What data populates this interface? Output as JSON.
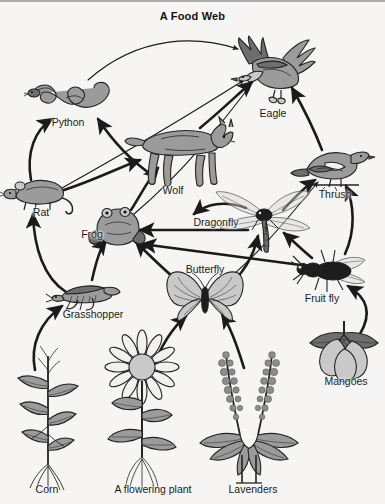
{
  "title": "A Food Web",
  "background_color": "#f6f5f3",
  "ink_color": "#232323",
  "organisms": [
    {
      "id": "python",
      "label": "Python",
      "label_x": 68,
      "label_y": 122,
      "x": 72,
      "y": 94,
      "group": "predator"
    },
    {
      "id": "eagle",
      "label": "Eagle",
      "label_x": 273,
      "label_y": 113,
      "x": 277,
      "y": 73,
      "group": "predator"
    },
    {
      "id": "wolf",
      "label": "Wolf",
      "label_x": 173,
      "label_y": 190,
      "x": 180,
      "y": 153,
      "group": "predator"
    },
    {
      "id": "thrush",
      "label": "Thrush",
      "label_x": 335,
      "label_y": 194,
      "x": 333,
      "y": 167,
      "group": "predator"
    },
    {
      "id": "rat",
      "label": "Rat",
      "label_x": 41,
      "label_y": 212,
      "x": 40,
      "y": 194,
      "group": "consumer"
    },
    {
      "id": "frog",
      "label": "Frog",
      "label_x": 92,
      "label_y": 234,
      "x": 118,
      "y": 226,
      "group": "consumer"
    },
    {
      "id": "dragonfly",
      "label": "Dragonfly",
      "label_x": 216,
      "label_y": 222,
      "x": 263,
      "y": 219,
      "group": "consumer"
    },
    {
      "id": "butterfly",
      "label": "Butterfly",
      "label_x": 205,
      "label_y": 269,
      "x": 205,
      "y": 298,
      "group": "consumer"
    },
    {
      "id": "fruitfly",
      "label": "Fruit fly",
      "label_x": 322,
      "label_y": 298,
      "x": 329,
      "y": 272,
      "group": "consumer"
    },
    {
      "id": "grasshopper",
      "label": "Grasshopper",
      "label_x": 93,
      "label_y": 314,
      "x": 85,
      "y": 294,
      "group": "consumer"
    },
    {
      "id": "corn",
      "label": "Corn",
      "label_x": 47,
      "label_y": 489,
      "x": 48,
      "y": 420,
      "group": "producer"
    },
    {
      "id": "flowering",
      "label": "A flowering plant",
      "label_x": 153,
      "label_y": 489,
      "x": 142,
      "y": 415,
      "group": "producer"
    },
    {
      "id": "lavenders",
      "label": "Lavenders",
      "label_x": 253,
      "label_y": 489,
      "x": 248,
      "y": 415,
      "group": "producer"
    },
    {
      "id": "mangoes",
      "label": "Mangoes",
      "label_x": 346,
      "label_y": 381,
      "x": 344,
      "y": 352,
      "group": "producer"
    }
  ],
  "feeding_links": [
    {
      "from": "python",
      "to": "eagle",
      "style": "thin"
    },
    {
      "from": "rat",
      "to": "python",
      "style": "thick"
    },
    {
      "from": "rat",
      "to": "wolf",
      "style": "thick"
    },
    {
      "from": "rat",
      "to": "eagle",
      "style": "thin"
    },
    {
      "from": "wolf",
      "to": "python",
      "style": "thick"
    },
    {
      "from": "wolf",
      "to": "eagle",
      "style": "thick"
    },
    {
      "from": "frog",
      "to": "wolf",
      "style": "thick"
    },
    {
      "from": "frog",
      "to": "eagle",
      "style": "thick"
    },
    {
      "from": "grasshopper",
      "to": "rat",
      "style": "thick"
    },
    {
      "from": "grasshopper",
      "to": "frog",
      "style": "thick"
    },
    {
      "from": "corn",
      "to": "grasshopper",
      "style": "thick"
    },
    {
      "from": "dragonfly",
      "to": "frog",
      "style": "thick"
    },
    {
      "from": "dragonfly",
      "to": "wolf",
      "style": "thick"
    },
    {
      "from": "dragonfly",
      "to": "thrush",
      "style": "thick"
    },
    {
      "from": "butterfly",
      "to": "frog",
      "style": "thick"
    },
    {
      "from": "butterfly",
      "to": "dragonfly",
      "style": "thick"
    },
    {
      "from": "butterfly",
      "to": "thrush",
      "style": "thin"
    },
    {
      "from": "fruitfly",
      "to": "frog",
      "style": "thick"
    },
    {
      "from": "fruitfly",
      "to": "dragonfly",
      "style": "thick"
    },
    {
      "from": "fruitfly",
      "to": "thrush",
      "style": "thick"
    },
    {
      "from": "thrush",
      "to": "eagle",
      "style": "thick"
    },
    {
      "from": "flowering",
      "to": "butterfly",
      "style": "thick"
    },
    {
      "from": "lavenders",
      "to": "butterfly",
      "style": "thick"
    },
    {
      "from": "mangoes",
      "to": "fruitfly",
      "style": "thick"
    }
  ]
}
